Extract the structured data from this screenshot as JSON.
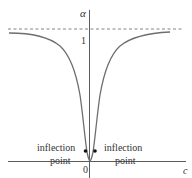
{
  "diagram": {
    "y_axis_label": "α",
    "x_axis_label": "c",
    "origin_label": "0",
    "asymptote_label": "1",
    "left_annotation": {
      "line1": "inflection",
      "line2": "point"
    },
    "right_annotation": {
      "line1": "inflection",
      "line2": "point"
    },
    "colors": {
      "axis": "#4a4a4a",
      "curve": "#6e6e6e",
      "dashed": "#666666",
      "points": "#111111",
      "text": "#333333"
    }
  }
}
